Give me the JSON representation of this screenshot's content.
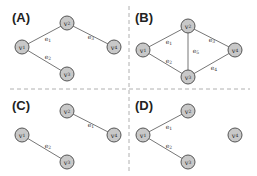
{
  "figure": {
    "width": 257,
    "height": 176,
    "colors": {
      "node_fill": "#c8c8c8",
      "node_border": "#555555",
      "edge": "#777777",
      "divider": "#b0b0b0",
      "text": "#222222"
    },
    "dividers": [
      {
        "orientation": "horizontal",
        "x1": 10,
        "y1": 89,
        "x2": 250,
        "y2": 89
      },
      {
        "orientation": "vertical",
        "x1": 129,
        "y1": 6,
        "x2": 129,
        "y2": 172
      }
    ],
    "panels": [
      {
        "id": "A",
        "label": "(A)",
        "label_pos": [
          12,
          10
        ],
        "nodes": [
          {
            "id": "v1",
            "base": "v",
            "sub": "1",
            "x": 22,
            "y": 47
          },
          {
            "id": "v2",
            "base": "v",
            "sub": "2",
            "x": 67,
            "y": 23
          },
          {
            "id": "v3",
            "base": "v",
            "sub": "3",
            "x": 67,
            "y": 74
          },
          {
            "id": "v4",
            "base": "v",
            "sub": "4",
            "x": 114,
            "y": 47
          }
        ],
        "edges": [
          {
            "from": "v1",
            "to": "v2",
            "base": "e",
            "sub": "1",
            "lx": 48,
            "ly": 39
          },
          {
            "from": "v2",
            "to": "v4",
            "base": "e",
            "sub": "3",
            "lx": 91,
            "ly": 37
          },
          {
            "from": "v1",
            "to": "v3",
            "base": "e",
            "sub": "2",
            "lx": 48,
            "ly": 57
          }
        ]
      },
      {
        "id": "B",
        "label": "(B)",
        "label_pos": [
          135,
          10
        ],
        "nodes": [
          {
            "id": "v1",
            "base": "v",
            "sub": "1",
            "x": 143,
            "y": 50
          },
          {
            "id": "v2",
            "base": "v",
            "sub": "2",
            "x": 188,
            "y": 26
          },
          {
            "id": "v3",
            "base": "v",
            "sub": "3",
            "x": 188,
            "y": 77
          },
          {
            "id": "v4",
            "base": "v",
            "sub": "4",
            "x": 235,
            "y": 50
          }
        ],
        "edges": [
          {
            "from": "v1",
            "to": "v2",
            "base": "e",
            "sub": "1",
            "lx": 169,
            "ly": 42
          },
          {
            "from": "v1",
            "to": "v3",
            "base": "e",
            "sub": "2",
            "lx": 169,
            "ly": 61
          },
          {
            "from": "v2",
            "to": "v3",
            "base": "e",
            "sub": "5",
            "lx": 196,
            "ly": 51
          },
          {
            "from": "v2",
            "to": "v4",
            "base": "e",
            "sub": "3",
            "lx": 212,
            "ly": 40
          },
          {
            "from": "v3",
            "to": "v4",
            "base": "e",
            "sub": "4",
            "lx": 214,
            "ly": 68
          }
        ]
      },
      {
        "id": "C",
        "label": "(C)",
        "label_pos": [
          12,
          98
        ],
        "nodes": [
          {
            "id": "v1",
            "base": "v",
            "sub": "1",
            "x": 22,
            "y": 135
          },
          {
            "id": "v2",
            "base": "v",
            "sub": "2",
            "x": 67,
            "y": 111
          },
          {
            "id": "v3",
            "base": "v",
            "sub": "3",
            "x": 67,
            "y": 162
          },
          {
            "id": "v4",
            "base": "v",
            "sub": "4",
            "x": 114,
            "y": 135
          }
        ],
        "edges": [
          {
            "from": "v2",
            "to": "v4",
            "base": "e",
            "sub": "1",
            "lx": 91,
            "ly": 125
          },
          {
            "from": "v1",
            "to": "v3",
            "base": "e",
            "sub": "2",
            "lx": 48,
            "ly": 146
          }
        ]
      },
      {
        "id": "D",
        "label": "(D)",
        "label_pos": [
          135,
          98
        ],
        "nodes": [
          {
            "id": "v1",
            "base": "v",
            "sub": "1",
            "x": 143,
            "y": 135
          },
          {
            "id": "v2",
            "base": "v",
            "sub": "2",
            "x": 188,
            "y": 111
          },
          {
            "id": "v3",
            "base": "v",
            "sub": "3",
            "x": 188,
            "y": 162
          },
          {
            "id": "v4",
            "base": "v",
            "sub": "4",
            "x": 235,
            "y": 135
          }
        ],
        "edges": [
          {
            "from": "v1",
            "to": "v2",
            "base": "e",
            "sub": "1",
            "lx": 169,
            "ly": 127
          },
          {
            "from": "v1",
            "to": "v3",
            "base": "e",
            "sub": "2",
            "lx": 169,
            "ly": 146
          }
        ]
      }
    ]
  }
}
